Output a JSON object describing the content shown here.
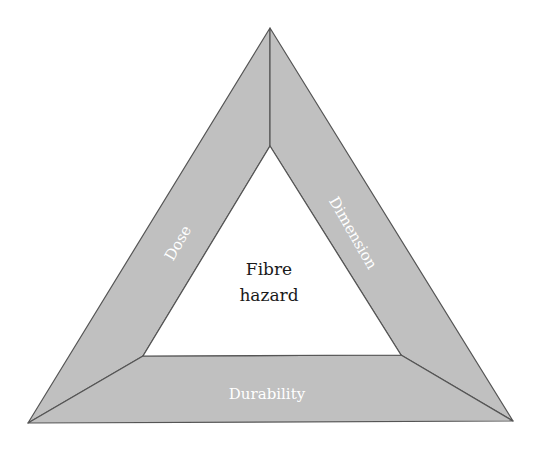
{
  "diagram": {
    "center": {
      "line1": "Fibre",
      "line2": "hazard"
    },
    "sides": {
      "left": "Dose",
      "right": "Dimension",
      "bottom": "Durability"
    },
    "colors": {
      "band_fill": "#c0c0c0",
      "stroke": "#555555",
      "side_text": "#ffffff",
      "center_text": "#1a1a1a"
    }
  }
}
